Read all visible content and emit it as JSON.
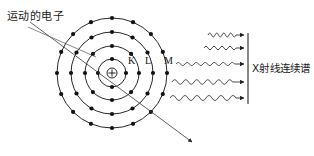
{
  "diagram": {
    "background_color": "#ffffff",
    "stroke_color": "#111111",
    "ray_color": "#333333",
    "pointer_color": "#555555"
  },
  "labels": {
    "incoming_electron": "运动的电子",
    "xray_spectrum": "X射线连续谱",
    "shell_K": "K",
    "shell_L": "L",
    "shell_M": "M"
  },
  "atom": {
    "center_x": 112,
    "center_y": 73,
    "nucleus_symbol": "+",
    "nucleus_radius": 5,
    "shells": [
      {
        "name": "K",
        "radius": 14,
        "electron_count": 4,
        "label": "K"
      },
      {
        "name": "L",
        "radius": 27,
        "electron_count": 8,
        "label": "L"
      },
      {
        "name": "M",
        "radius": 41,
        "electron_count": 12,
        "label": "M"
      },
      {
        "name": "N",
        "radius": 55,
        "electron_count": 16,
        "label": ""
      }
    ],
    "electron_dot_radius": 2.1
  },
  "electron_path": {
    "start_x": 30,
    "start_y": 22,
    "end_x": 192,
    "end_y": 142,
    "has_arrowhead": true
  },
  "pointer_line": {
    "start_x": 28,
    "start_y": 27,
    "end_x": 96,
    "end_y": 57
  },
  "xrays": {
    "count": 5,
    "wave_color": "#333333",
    "rays": [
      {
        "index": 1,
        "x_start": 208,
        "x_end": 244,
        "y": 35,
        "amplitude": 1.9,
        "wavelength": 7
      },
      {
        "index": 2,
        "x_start": 204,
        "x_end": 244,
        "y": 48,
        "amplitude": 1.6,
        "wavelength": 8
      },
      {
        "index": 3,
        "x_start": 176,
        "x_end": 244,
        "y": 64,
        "amplitude": 1.5,
        "wavelength": 9
      },
      {
        "index": 4,
        "x_start": 172,
        "x_end": 244,
        "y": 82,
        "amplitude": 2.2,
        "wavelength": 11
      },
      {
        "index": 5,
        "x_start": 170,
        "x_end": 244,
        "y": 98,
        "amplitude": 2.4,
        "wavelength": 12
      }
    ]
  },
  "bracket": {
    "x": 248,
    "y_top": 33,
    "y_bottom": 104
  }
}
